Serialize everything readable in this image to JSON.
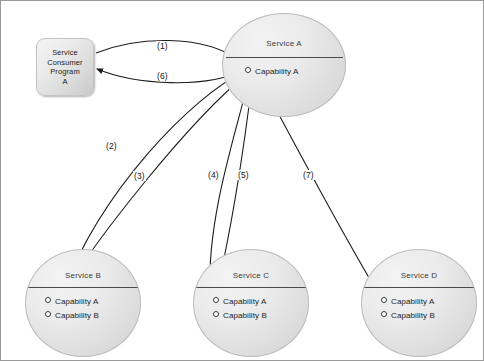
{
  "diagram": {
    "title_text": "",
    "consumer": {
      "name": "service-consumer-program-a",
      "label": "Service\nConsumer\nProgram\nA"
    },
    "services": [
      {
        "id": "service-a",
        "title": "Service A",
        "capabilities": [
          "Capability A"
        ]
      },
      {
        "id": "service-b",
        "title": "Service B",
        "capabilities": [
          "Capability A",
          "Capability B"
        ]
      },
      {
        "id": "service-c",
        "title": "Service C",
        "capabilities": [
          "Capability A",
          "Capability B"
        ]
      },
      {
        "id": "service-d",
        "title": "Service D",
        "capabilities": [
          "Capability A",
          "Capability B"
        ]
      }
    ],
    "flows": [
      {
        "id": "flow-1",
        "label": "(1)",
        "from": "Service Consumer Program A",
        "to": "Service A : Capability A"
      },
      {
        "id": "flow-2",
        "label": "(2)",
        "from": "Service A : Capability A",
        "to": "Service B : Capability A"
      },
      {
        "id": "flow-3",
        "label": "(3)",
        "from": "Service B : Capability A",
        "to": "Service A : Capability A"
      },
      {
        "id": "flow-4",
        "label": "(4)",
        "from": "Service A : Capability A",
        "to": "Service C : Capability A"
      },
      {
        "id": "flow-5",
        "label": "(5)",
        "from": "Service C : Capability A",
        "to": "Service A : Capability A"
      },
      {
        "id": "flow-6",
        "label": "(6)",
        "from": "Service A : Capability A",
        "to": "Service Consumer Program A"
      },
      {
        "id": "flow-7",
        "label": "(7)",
        "from": "Service A : Capability A",
        "to": "Service D : Capability A"
      }
    ],
    "colors": {
      "line": "#222222",
      "border": "#9a9a9a",
      "circle_fill": "#e6e6e6",
      "box_fill": "#e8e8e8",
      "text": "#1b1b1b"
    }
  }
}
